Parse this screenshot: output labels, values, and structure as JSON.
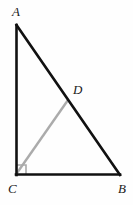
{
  "figure": {
    "type": "right-triangle-with-cevian",
    "background_color": "#fefefe",
    "stroke_color": "#111111",
    "accent_color": "#ababab",
    "labels": {
      "a": "A",
      "b": "B",
      "c": "C",
      "d": "D"
    },
    "points": {
      "A": {
        "x": 16,
        "y": 25
      },
      "B": {
        "x": 120,
        "y": 175
      },
      "C": {
        "x": 16,
        "y": 175
      },
      "D": {
        "x": 68,
        "y": 100
      }
    },
    "segments": [
      {
        "name": "AC",
        "from": "A",
        "to": "C",
        "color": "#111111",
        "width": 2.6
      },
      {
        "name": "CB",
        "from": "C",
        "to": "B",
        "color": "#111111",
        "width": 2.6
      },
      {
        "name": "AB",
        "from": "A",
        "to": "B",
        "color": "#111111",
        "width": 2.6
      },
      {
        "name": "CD",
        "from": "C",
        "to": "D",
        "color": "#ababab",
        "width": 2.4
      }
    ],
    "right_angle": {
      "at": "C",
      "size": 9,
      "color": "#ababab"
    }
  }
}
